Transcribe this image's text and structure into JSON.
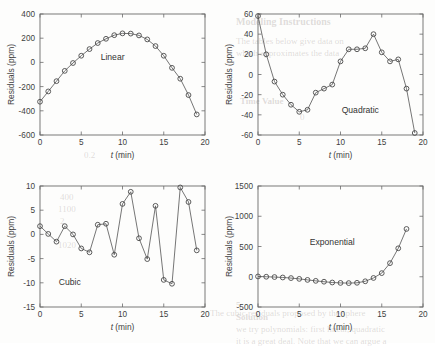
{
  "figure": {
    "background_color": "#fdfdfc",
    "axis_color": "#6a6a6a",
    "line_color": "#5d5d5d",
    "marker_color": "#4a4a4a",
    "shared_xlabel_text": "t (min)",
    "shared_xlabel_italic": "t",
    "shared_xlabel_unit": " (min)",
    "shared_ylabel": "Residuals (ppm)"
  },
  "ghost_text": [
    {
      "text": "Modeling Instructions",
      "x": 236,
      "y": 16,
      "size": 10,
      "weight": "bold"
    },
    {
      "text": "The tables below give data on",
      "x": 236,
      "y": 36,
      "size": 9,
      "weight": "normal"
    },
    {
      "text": "which approximates the data",
      "x": 236,
      "y": 48,
      "size": 9,
      "weight": "normal"
    },
    {
      "text": "Time  Value",
      "x": 240,
      "y": 96,
      "size": 9,
      "weight": "bold"
    },
    {
      "text": "0",
      "x": 300,
      "y": 112,
      "size": 9,
      "weight": "normal"
    },
    {
      "text": "1",
      "x": 120,
      "y": 150,
      "size": 9,
      "weight": "normal"
    },
    {
      "text": "0.2",
      "x": 84,
      "y": 150,
      "size": 9,
      "weight": "normal"
    },
    {
      "text": "400",
      "x": 60,
      "y": 192,
      "size": 9,
      "weight": "normal"
    },
    {
      "text": "1100",
      "x": 58,
      "y": 204,
      "size": 9,
      "weight": "normal"
    },
    {
      "text": "2",
      "x": 60,
      "y": 216,
      "size": 9,
      "weight": "normal"
    },
    {
      "text": "1020",
      "x": 58,
      "y": 240,
      "size": 9,
      "weight": "normal"
    },
    {
      "text": "5",
      "x": 236,
      "y": 300,
      "size": 9,
      "weight": "bold"
    },
    {
      "text": "Solution",
      "x": 236,
      "y": 312,
      "size": 9,
      "weight": "bold"
    },
    {
      "text": "we try polynomials: first linear, quadratic",
      "x": 236,
      "y": 324,
      "size": 9,
      "weight": "normal"
    },
    {
      "text": "it is a great deal. Note that we can argue a",
      "x": 236,
      "y": 336,
      "size": 9,
      "weight": "normal"
    },
    {
      "text": "The cubic residuals proposed by the sphere",
      "x": 210,
      "y": 308,
      "size": 9,
      "weight": "normal"
    }
  ],
  "chart_data": [
    {
      "id": "linear",
      "type": "line",
      "title": "Linear",
      "xlabel": "t (min)",
      "ylabel": "Residuals (ppm)",
      "xlim": [
        0,
        20
      ],
      "ylim": [
        -600,
        400
      ],
      "xticks": [
        0,
        5,
        10,
        15,
        20
      ],
      "yticks": [
        -600,
        -400,
        -200,
        0,
        200,
        400
      ],
      "grid": false,
      "markers": "circle",
      "x": [
        0,
        1,
        2,
        3,
        4,
        5,
        6,
        7,
        8,
        9,
        10,
        11,
        12,
        13,
        14,
        15,
        16,
        17,
        18,
        19
      ],
      "y": [
        -325,
        -240,
        -155,
        -70,
        -5,
        55,
        110,
        160,
        195,
        225,
        240,
        238,
        223,
        190,
        135,
        55,
        -45,
        -135,
        -270,
        -430
      ]
    },
    {
      "id": "quadratic",
      "type": "line",
      "title": "Quadratic",
      "xlabel": "t (min)",
      "ylabel": "Residuals (ppm)",
      "xlim": [
        0,
        20
      ],
      "ylim": [
        -60,
        60
      ],
      "xticks": [
        0,
        5,
        10,
        15,
        20
      ],
      "yticks": [
        -60,
        -40,
        -20,
        0,
        20,
        40,
        60
      ],
      "grid": false,
      "markers": "circle",
      "x": [
        0,
        1,
        2,
        3,
        4,
        5,
        6,
        7,
        8,
        9,
        10,
        11,
        12,
        13,
        14,
        15,
        16,
        17,
        18,
        19
      ],
      "y": [
        58,
        20,
        -7,
        -20,
        -30,
        -37,
        -35,
        -18,
        -14,
        -10,
        13,
        25,
        25,
        26,
        40,
        22,
        13,
        15,
        -14,
        -58
      ]
    },
    {
      "id": "cubic",
      "type": "line",
      "title": "Cubic",
      "xlabel": "t (min)",
      "ylabel": "Residuals (ppm)",
      "xlim": [
        0,
        20
      ],
      "ylim": [
        -15,
        10
      ],
      "xticks": [
        0,
        5,
        10,
        15,
        20
      ],
      "yticks": [
        -15,
        -10,
        -5,
        0,
        5,
        10
      ],
      "grid": false,
      "markers": "circle",
      "x": [
        0,
        1,
        2,
        3,
        4,
        5,
        6,
        7,
        8,
        9,
        10,
        11,
        12,
        13,
        14,
        15,
        16,
        17,
        18,
        19
      ],
      "y": [
        1.7,
        0.1,
        -1.5,
        1.7,
        0.0,
        -2.9,
        -3.7,
        2.0,
        2.2,
        -4.2,
        6.3,
        8.8,
        -0.8,
        -5.1,
        5.9,
        -9.4,
        -10.2,
        9.7,
        6.7,
        -3.3
      ]
    },
    {
      "id": "exponential",
      "type": "line",
      "title": "Exponential",
      "xlabel": "t (min)",
      "ylabel": "Residuals (ppm)",
      "xlim": [
        0,
        20
      ],
      "ylim": [
        -500,
        1500
      ],
      "xticks": [
        0,
        5,
        10,
        15,
        20
      ],
      "yticks": [
        -500,
        0,
        500,
        1000,
        1500
      ],
      "grid": false,
      "markers": "circle",
      "x": [
        0,
        1,
        2,
        3,
        4,
        5,
        6,
        7,
        8,
        9,
        10,
        11,
        12,
        13,
        14,
        15,
        16,
        17,
        18
      ],
      "y": [
        5,
        0,
        -5,
        -12,
        -22,
        -35,
        -52,
        -68,
        -82,
        -95,
        -102,
        -105,
        -100,
        -75,
        -20,
        60,
        225,
        470,
        790,
        1300
      ]
    }
  ]
}
